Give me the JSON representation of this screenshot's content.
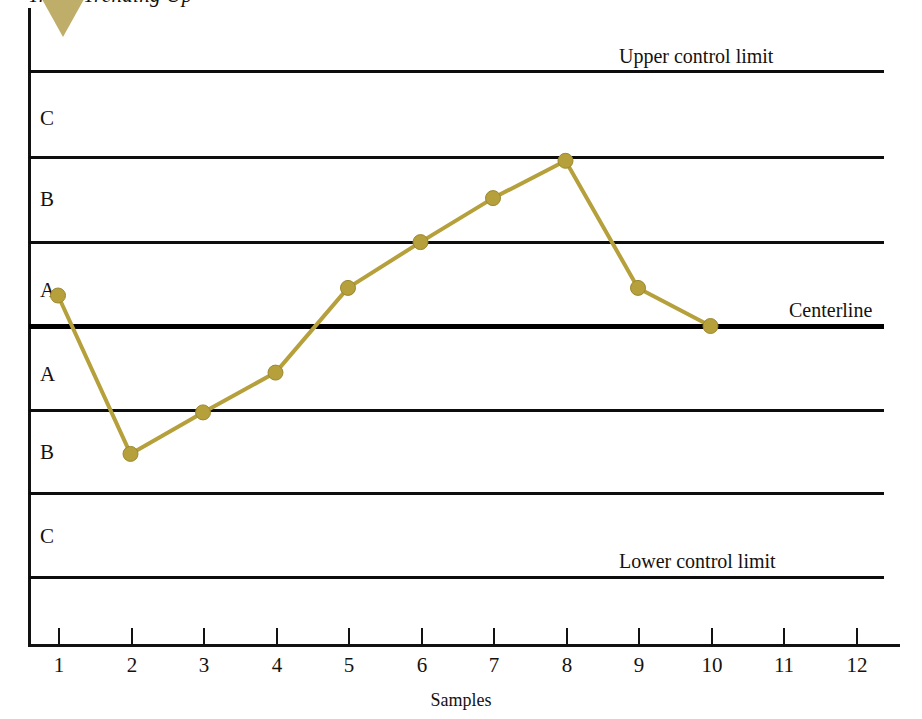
{
  "title": "Trend Trending Up",
  "axis": {
    "x_title": "Samples",
    "x_ticks": [
      "1",
      "2",
      "3",
      "4",
      "5",
      "6",
      "7",
      "8",
      "9",
      "10",
      "11",
      "12"
    ]
  },
  "zones": {
    "upper_c": "C",
    "upper_b": "B",
    "upper_a": "A",
    "lower_a": "A",
    "lower_b": "B",
    "lower_c": "C"
  },
  "limits": {
    "upper": "Upper control limit",
    "center": "Centerline",
    "lower": "Lower control limit"
  },
  "colors": {
    "series": "#b6a03c",
    "marker": "#b6a03c",
    "marker_edge": "#9c8830",
    "line": "#0d0d0d",
    "trend_marker": "#bfae6a"
  },
  "chart_data": {
    "type": "line",
    "title": "Trend Trending Up",
    "xlabel": "Samples",
    "ylabel": "",
    "grid": true,
    "legend": false,
    "x": [
      1,
      2,
      3,
      4,
      5,
      6,
      7,
      8,
      9,
      10
    ],
    "values_sigma": [
      0.36,
      -1.51,
      -1.02,
      -0.55,
      0.45,
      0.99,
      1.51,
      1.95,
      0.45,
      0.0
    ],
    "xlim": [
      0.5,
      12.5
    ],
    "ylim_sigma": [
      -3.8,
      3.8
    ],
    "series": [
      {
        "name": "Sample measurement",
        "values": [
          0.36,
          -1.51,
          -1.02,
          -0.55,
          0.45,
          0.99,
          1.51,
          1.95,
          0.45,
          0.0
        ]
      }
    ],
    "control_limits": {
      "upper_control_limit_sigma": 3,
      "centerline_sigma": 0,
      "lower_control_limit_sigma": -3,
      "zone_boundaries_sigma": [
        3,
        2,
        1,
        0,
        -1,
        -2,
        -3
      ]
    },
    "zone_labels_top_to_bottom": [
      "C",
      "B",
      "A",
      "A",
      "B",
      "C"
    ],
    "annotations": [
      "Upper control limit",
      "Centerline",
      "Lower control limit"
    ]
  }
}
